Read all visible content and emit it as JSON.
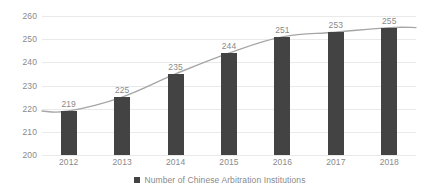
{
  "chart_data": {
    "type": "bar",
    "title": "",
    "xlabel": "",
    "ylabel": "",
    "categories": [
      "2012",
      "2013",
      "2014",
      "2015",
      "2016",
      "2017",
      "2018"
    ],
    "values": [
      219,
      225,
      235,
      244,
      251,
      253,
      255
    ],
    "data_labels": [
      "219",
      "225",
      "235",
      "244",
      "251",
      "253",
      "255"
    ],
    "ylim": [
      200,
      260
    ],
    "yticks": [
      200,
      210,
      220,
      230,
      240,
      250,
      260
    ],
    "ytick_labels": [
      "200",
      "210",
      "220",
      "230",
      "240",
      "250",
      "260"
    ],
    "grid": true,
    "grid_axis": "y",
    "legend_position": "bottom",
    "series": [
      {
        "name": "Number of Chinese Arbitration Institutions",
        "type": "bar",
        "color": "#434343",
        "values": [
          219,
          225,
          235,
          244,
          251,
          253,
          255
        ]
      },
      {
        "name": "trend-line",
        "type": "line",
        "color": "#a6a6a6",
        "values": [
          219,
          225,
          235,
          244,
          251,
          253,
          255
        ]
      }
    ]
  },
  "legend": {
    "marker_color": "#434343",
    "label": "Number of Chinese Arbitration Institutions"
  },
  "colors": {
    "bar": "#434343",
    "line": "#a6a6a6",
    "grid": "#e9e9e9",
    "text": "#8a8a8a",
    "background": "#ffffff"
  }
}
